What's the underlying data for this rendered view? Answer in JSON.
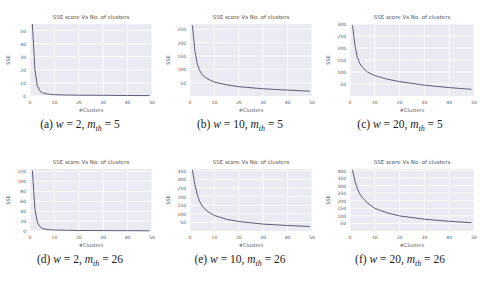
{
  "figure": {
    "panels": [
      {
        "id": "a",
        "caption_prefix": "(a)",
        "w": "2",
        "m_th": "5"
      },
      {
        "id": "b",
        "caption_prefix": "(b)",
        "w": "10",
        "m_th": "5"
      },
      {
        "id": "c",
        "caption_prefix": "(c)",
        "w": "20",
        "m_th": "5"
      },
      {
        "id": "d",
        "caption_prefix": "(d)",
        "w": "2",
        "m_th": "26"
      },
      {
        "id": "e",
        "caption_prefix": "(e)",
        "w": "10",
        "m_th": "26"
      },
      {
        "id": "f",
        "caption_prefix": "(f)",
        "w": "20",
        "m_th": "26"
      }
    ]
  },
  "chart_data": [
    {
      "type": "line",
      "title": "SSE score Vs No. of clusters",
      "xlabel": "#Clusters",
      "ylabel": "SSE",
      "xlim": [
        0,
        50
      ],
      "ylim": [
        0,
        55
      ],
      "xticks": [
        0,
        10,
        20,
        30,
        40,
        50
      ],
      "yticks": [
        0,
        10,
        20,
        30,
        40,
        50
      ],
      "grid": true,
      "x": [
        1,
        2,
        3,
        4,
        5,
        7,
        10,
        15,
        20,
        30,
        40,
        49
      ],
      "values": [
        55,
        20,
        8,
        4,
        2.5,
        1.5,
        1,
        0.8,
        0.6,
        0.5,
        0.4,
        0.3
      ]
    },
    {
      "type": "line",
      "title": "SSE score Vs No. of clusters",
      "xlabel": "#Clusters",
      "ylabel": "SSE",
      "xlim": [
        0,
        50
      ],
      "ylim": [
        0,
        270
      ],
      "xticks": [
        0,
        10,
        20,
        30,
        40,
        50
      ],
      "yticks": [
        50,
        100,
        150,
        200,
        250
      ],
      "grid": true,
      "x": [
        1,
        2,
        3,
        4,
        5,
        7,
        10,
        15,
        20,
        30,
        40,
        49
      ],
      "values": [
        265,
        170,
        120,
        95,
        80,
        65,
        52,
        42,
        35,
        27,
        22,
        18
      ]
    },
    {
      "type": "line",
      "title": "SSE score Vs No. of clusters",
      "xlabel": "#Clusters",
      "ylabel": "SSE",
      "xlim": [
        0,
        50
      ],
      "ylim": [
        0,
        300
      ],
      "xticks": [
        0,
        10,
        20,
        30,
        40,
        50
      ],
      "yticks": [
        50,
        100,
        150,
        200,
        250,
        300
      ],
      "grid": true,
      "x": [
        1,
        2,
        3,
        4,
        5,
        7,
        10,
        15,
        20,
        30,
        40,
        49
      ],
      "values": [
        295,
        210,
        160,
        135,
        120,
        100,
        85,
        70,
        60,
        45,
        35,
        28
      ]
    },
    {
      "type": "line",
      "title": "SSE score Vs No. of clusters",
      "xlabel": "#Clusters",
      "ylabel": "SSE",
      "xlim": [
        0,
        50
      ],
      "ylim": [
        0,
        125
      ],
      "xticks": [
        0,
        10,
        20,
        30,
        40,
        50
      ],
      "yticks": [
        0,
        20,
        40,
        60,
        80,
        100,
        120
      ],
      "grid": true,
      "x": [
        1,
        2,
        3,
        4,
        5,
        7,
        10,
        15,
        20,
        30,
        40,
        49
      ],
      "values": [
        122,
        45,
        18,
        9,
        5,
        3,
        2,
        1.5,
        1,
        0.8,
        0.6,
        0.5
      ]
    },
    {
      "type": "line",
      "title": "SSE score Vs No. of clusters",
      "xlabel": "#Clusters",
      "ylabel": "SSE",
      "xlim": [
        0,
        50
      ],
      "ylim": [
        0,
        360
      ],
      "xticks": [
        0,
        10,
        20,
        30,
        40,
        50
      ],
      "yticks": [
        50,
        100,
        150,
        200,
        250,
        300,
        350
      ],
      "grid": true,
      "x": [
        1,
        2,
        3,
        4,
        5,
        7,
        10,
        15,
        20,
        30,
        40,
        49
      ],
      "values": [
        355,
        270,
        210,
        170,
        145,
        115,
        90,
        68,
        55,
        40,
        32,
        26
      ]
    },
    {
      "type": "line",
      "title": "SSE score Vs No. of clusters",
      "xlabel": "#Clusters",
      "ylabel": "SSE",
      "xlim": [
        0,
        50
      ],
      "ylim": [
        0,
        410
      ],
      "xticks": [
        0,
        10,
        20,
        30,
        40,
        50
      ],
      "yticks": [
        50,
        100,
        150,
        200,
        250,
        300,
        350,
        400
      ],
      "grid": true,
      "x": [
        1,
        2,
        3,
        4,
        5,
        7,
        10,
        15,
        20,
        30,
        40,
        49
      ],
      "values": [
        405,
        330,
        280,
        245,
        220,
        185,
        150,
        120,
        100,
        78,
        64,
        55
      ]
    }
  ]
}
